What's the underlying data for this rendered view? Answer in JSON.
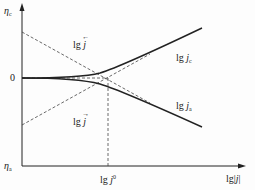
{
  "diagram": {
    "title": "",
    "y_axis": {
      "top_label_symbol": "η",
      "top_label_sub": "c",
      "bottom_label_symbol": "η",
      "bottom_label_sub": "a",
      "zero_label": "0"
    },
    "x_axis": {
      "label_prefix": "lg|",
      "label_var": "j",
      "label_suffix": "|",
      "tick_label_prefix": "lg ",
      "tick_label_var": "j",
      "tick_label_sup": "0"
    },
    "curves": [
      {
        "name": "cathodic",
        "label_prefix": "lg ",
        "label_var": "j",
        "label_sub": "c"
      },
      {
        "name": "anodic",
        "label_prefix": "lg ",
        "label_var": "j",
        "label_sub": "a"
      }
    ],
    "asymptotes": [
      {
        "name": "upper-dashed",
        "label_prefix": "lg ",
        "label_var": "j",
        "arrow": "←"
      },
      {
        "name": "lower-dashed",
        "label_prefix": "lg ",
        "label_var": "j",
        "arrow": "→"
      }
    ],
    "colors": {
      "line": "#222222",
      "dashed": "#444444",
      "background": "#fdfdfd"
    }
  }
}
